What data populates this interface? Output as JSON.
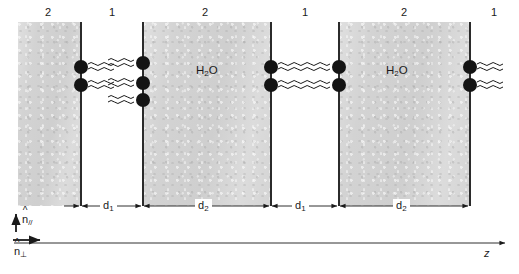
{
  "figure": {
    "background_color": "#ffffff",
    "slab_color": "#d2d2d2",
    "line_color": "#2b2b2b",
    "head_color": "#141414"
  },
  "region_labels": [
    {
      "text": "2",
      "x": 48,
      "y": 8
    },
    {
      "text": "1",
      "x": 112,
      "y": 8
    },
    {
      "text": "2",
      "x": 205,
      "y": 8
    },
    {
      "text": "1",
      "x": 305,
      "y": 8
    },
    {
      "text": "2",
      "x": 404,
      "y": 8
    },
    {
      "text": "1",
      "x": 494,
      "y": 8
    }
  ],
  "water_labels": [
    {
      "text": "H2O",
      "html": "H<sub>2</sub>O",
      "x": 196,
      "y": 64
    },
    {
      "text": "H2O",
      "html": "H<sub>2</sub>O",
      "x": 386,
      "y": 64
    }
  ],
  "dimension_labels": [
    {
      "text": "d1",
      "html": "d<sub>1</sub>",
      "x": 105,
      "y": 198
    },
    {
      "text": "d2",
      "html": "d<sub>2</sub>",
      "x": 200,
      "y": 198
    },
    {
      "text": "d1",
      "html": "d<sub>1</sub>",
      "x": 297,
      "y": 198
    },
    {
      "text": "d2",
      "html": "d<sub>2</sub>",
      "x": 398,
      "y": 198
    }
  ],
  "axis_labels": {
    "parallel": {
      "symbol": "n",
      "hat": "^",
      "subscript": "//",
      "x": 20,
      "y": 216
    },
    "perpendicular": {
      "symbol": "n",
      "hat": "^",
      "subscript": "⊥",
      "x": 20,
      "y": 248
    },
    "z_axis": {
      "text": "z",
      "x": 486,
      "y": 248
    }
  },
  "slabs": [
    {
      "name": "region-2-slab-left-partial",
      "x": 18,
      "y": 22,
      "width": 63,
      "height": 184
    },
    {
      "name": "region-2-slab-middle",
      "x": 143,
      "y": 22,
      "width": 128,
      "height": 184
    },
    {
      "name": "region-2-slab-right",
      "x": 339,
      "y": 22,
      "width": 131,
      "height": 184
    }
  ],
  "bilayer_lines": [
    {
      "name": "bilayer-line-1",
      "x": 80,
      "y": 22,
      "height": 184
    },
    {
      "name": "bilayer-line-2",
      "x": 142,
      "y": 22,
      "height": 184
    },
    {
      "name": "bilayer-line-3",
      "x": 270,
      "y": 22,
      "height": 184
    },
    {
      "name": "bilayer-line-4",
      "x": 338,
      "y": 22,
      "height": 184
    },
    {
      "name": "bilayer-line-5",
      "x": 469,
      "y": 22,
      "height": 184
    }
  ],
  "lipids": [
    {
      "line": 1,
      "head_x": 74,
      "head_y": 60,
      "tail_dir": "right"
    },
    {
      "line": 1,
      "head_x": 74,
      "head_y": 78,
      "tail_dir": "right"
    },
    {
      "line": 2,
      "head_x": 136,
      "head_y": 56,
      "tail_dir": "left"
    },
    {
      "line": 2,
      "head_x": 136,
      "head_y": 76,
      "tail_dir": "left"
    },
    {
      "line": 2,
      "head_x": 136,
      "head_y": 93,
      "tail_dir": "left"
    },
    {
      "line": 3,
      "head_x": 264,
      "head_y": 60,
      "tail_dir": "right"
    },
    {
      "line": 3,
      "head_x": 264,
      "head_y": 78,
      "tail_dir": "right"
    },
    {
      "line": 4,
      "head_x": 332,
      "head_y": 60,
      "tail_dir": "left"
    },
    {
      "line": 4,
      "head_x": 332,
      "head_y": 78,
      "tail_dir": "left"
    },
    {
      "line": 5,
      "head_x": 463,
      "head_y": 60,
      "tail_dir": "right"
    },
    {
      "line": 5,
      "head_x": 463,
      "head_y": 78,
      "tail_dir": "right"
    }
  ],
  "dimension_spans": [
    {
      "name": "d1-span-left",
      "x1": 81,
      "x2": 142,
      "y": 206
    },
    {
      "name": "d2-span-left",
      "x1": 143,
      "x2": 270,
      "y": 206
    },
    {
      "name": "d1-span-right",
      "x1": 271,
      "x2": 338,
      "y": 206
    },
    {
      "name": "d2-span-right",
      "x1": 339,
      "x2": 469,
      "y": 206
    }
  ],
  "z_axis_line": {
    "x1": 14,
    "x2": 508,
    "y": 243
  },
  "n_parallel_arrow": {
    "x": 16,
    "y1": 232,
    "y2": 213
  },
  "n_perp_arrow": {
    "x1": 13,
    "x2": 42,
    "y": 240
  }
}
